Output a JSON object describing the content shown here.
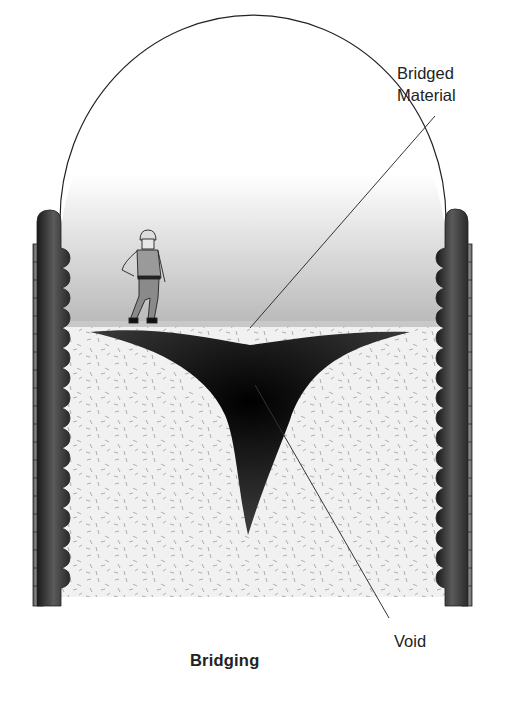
{
  "diagram": {
    "title": "Bridging",
    "labels": {
      "bridged_material_line1": "Bridged",
      "bridged_material_line2": "Material",
      "void": "Void"
    },
    "elements": [
      "silo-dome",
      "silo-walls",
      "worker-figure",
      "bridged-material-surface",
      "void-cavity",
      "bulk-material-fill"
    ],
    "colors": {
      "outline": "#222222",
      "void": "#111111",
      "fill": "#f0f0f0",
      "wall": "#3a3a3a"
    }
  }
}
